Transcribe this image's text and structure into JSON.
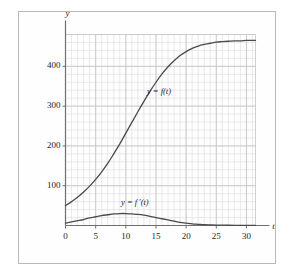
{
  "figure": {
    "background": "#ffffff",
    "frame_color": "#b9b9b9",
    "curve_color": "#4a4a4a",
    "axis_color": "#6e6e6e",
    "grid_minor_color": "#dcdcdc",
    "grid_major_color": "#c4c4c4"
  },
  "chart_data": {
    "type": "line",
    "title": "",
    "xlabel": "t",
    "ylabel": "y",
    "xlim": [
      0,
      31.5
    ],
    "ylim": [
      0,
      480
    ],
    "grid": true,
    "grid_minor_step_x": 1,
    "grid_minor_step_y": 20,
    "legend": "inline-labels",
    "xticks": [
      0,
      5,
      10,
      15,
      20,
      25,
      30
    ],
    "xticklabels": [
      "0",
      "5",
      "10",
      "15",
      "20",
      "25",
      "30"
    ],
    "yticks": [
      100,
      200,
      300,
      400
    ],
    "yticklabels": [
      "100",
      "200",
      "300",
      "400"
    ],
    "annotations": [
      {
        "text": "y = f(t)",
        "x": 15.5,
        "y": 335
      },
      {
        "text": "y = f ′(t)",
        "x": 11.5,
        "y": 57
      }
    ],
    "series": [
      {
        "name": "y = f(t)",
        "x": [
          0,
          1,
          2,
          3,
          4,
          5,
          6,
          7,
          8,
          9,
          10,
          11,
          12,
          13,
          14,
          15,
          16,
          17,
          18,
          19,
          20,
          21,
          22,
          23,
          24,
          25,
          26,
          27,
          28,
          29,
          30,
          31,
          31.5
        ],
        "values": [
          50,
          60,
          71,
          84,
          99,
          116,
          135,
          156,
          180,
          205,
          232,
          259,
          286,
          312,
          337,
          360,
          381,
          399,
          414,
          427,
          437,
          445,
          451,
          455,
          458,
          461,
          462,
          463,
          464,
          464,
          465,
          465,
          465
        ]
      },
      {
        "name": "y = f ′(t)",
        "x": [
          0,
          1,
          2,
          3,
          4,
          5,
          6,
          7,
          8,
          9,
          10,
          11,
          12,
          13,
          14,
          15,
          16,
          17,
          18,
          19,
          20,
          21,
          22,
          23,
          24,
          25,
          26,
          27,
          28,
          29,
          30,
          31,
          31.5
        ],
        "values": [
          6,
          9,
          12,
          15,
          19,
          22,
          25,
          27,
          29,
          30,
          30,
          29,
          28,
          26,
          23,
          20,
          17,
          14,
          11,
          8,
          6,
          4,
          3,
          2,
          1.5,
          1,
          0.8,
          0.6,
          0.5,
          0.4,
          0.3,
          0.2,
          0.2
        ]
      }
    ]
  }
}
